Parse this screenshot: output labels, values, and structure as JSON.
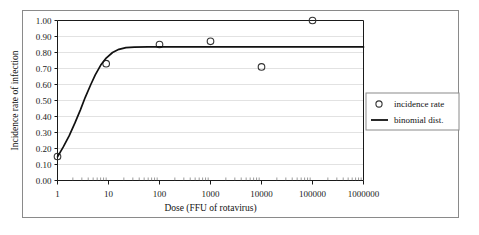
{
  "chart_data": {
    "type": "scatter",
    "title": "",
    "xlabel": "Dose (FFU of rotavirus)",
    "ylabel": "Incidence rate of infection",
    "xscale": "log",
    "xlim": [
      1,
      1000000
    ],
    "ylim": [
      0.0,
      1.0
    ],
    "grid": true,
    "legend_position": "right",
    "xticks": [
      "1",
      "10",
      "100",
      "1000",
      "10000",
      "100000",
      "1000000"
    ],
    "xtick_values": [
      1,
      10,
      100,
      1000,
      10000,
      100000,
      1000000
    ],
    "yticks": [
      "0.00",
      "0.10",
      "0.20",
      "0.30",
      "0.40",
      "0.50",
      "0.60",
      "0.70",
      "0.80",
      "0.90",
      "1.00"
    ],
    "ytick_values": [
      0.0,
      0.1,
      0.2,
      0.3,
      0.4,
      0.5,
      0.6,
      0.7,
      0.8,
      0.9,
      1.0
    ],
    "series": [
      {
        "name": "incidence rate",
        "type": "scatter",
        "marker": "open-circle",
        "color": "#333333",
        "points": [
          {
            "x": 1,
            "y": 0.15
          },
          {
            "x": 9,
            "y": 0.73
          },
          {
            "x": 100,
            "y": 0.85
          },
          {
            "x": 1000,
            "y": 0.87
          },
          {
            "x": 10000,
            "y": 0.71
          },
          {
            "x": 100000,
            "y": 1.0
          }
        ]
      },
      {
        "name": "binomial dist.",
        "type": "line",
        "color": "#111111",
        "points": [
          {
            "x": 1,
            "y": 0.148
          },
          {
            "x": 1.3,
            "y": 0.21
          },
          {
            "x": 1.7,
            "y": 0.28
          },
          {
            "x": 2.2,
            "y": 0.36
          },
          {
            "x": 2.8,
            "y": 0.44
          },
          {
            "x": 3.5,
            "y": 0.52
          },
          {
            "x": 4.5,
            "y": 0.6
          },
          {
            "x": 5.5,
            "y": 0.66
          },
          {
            "x": 7,
            "y": 0.72
          },
          {
            "x": 9,
            "y": 0.765
          },
          {
            "x": 12,
            "y": 0.8
          },
          {
            "x": 16,
            "y": 0.82
          },
          {
            "x": 22,
            "y": 0.83
          },
          {
            "x": 32,
            "y": 0.834
          },
          {
            "x": 60,
            "y": 0.835
          },
          {
            "x": 200,
            "y": 0.835
          },
          {
            "x": 1000,
            "y": 0.835
          },
          {
            "x": 10000,
            "y": 0.835
          },
          {
            "x": 100000,
            "y": 0.835
          },
          {
            "x": 1000000,
            "y": 0.835
          }
        ]
      }
    ]
  },
  "legend": {
    "items": [
      {
        "label": "incidence rate",
        "marker": "open-circle"
      },
      {
        "label": "binomial dist.",
        "marker": "line"
      }
    ]
  },
  "colors": {
    "frame": "#8a8a8a",
    "axis": "#1a1a1a",
    "grid": "#e2e2e2",
    "curve": "#111111",
    "marker": "#333333"
  }
}
